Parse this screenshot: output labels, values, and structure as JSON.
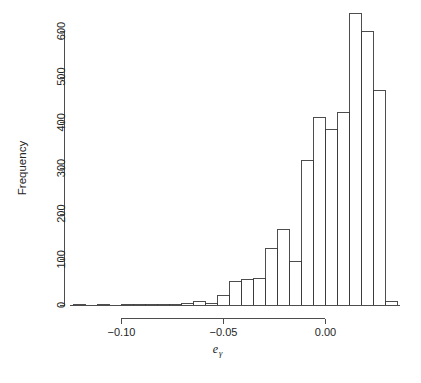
{
  "figure": {
    "ylabel": "Frequency",
    "xlabel_base": "e",
    "xlabel_sub": "γ",
    "caption_fragment": ""
  },
  "chart_data": {
    "type": "bar",
    "title": "",
    "xlabel": "eγ",
    "ylabel": "Frequency",
    "grid": false,
    "legend": "none",
    "xlim": [
      -0.128,
      0.0295
    ],
    "ylim": [
      0,
      640
    ],
    "ytick_values": [
      0,
      100,
      200,
      300,
      400,
      500,
      600
    ],
    "ytick_labels": [
      "0",
      "100",
      "200",
      "300",
      "400",
      "500",
      "600"
    ],
    "xtick_values": [
      -0.1,
      -0.05,
      0.0
    ],
    "xtick_labels": [
      "-0.10",
      "-0.05",
      "0.00"
    ],
    "bin_width": 0.006,
    "bin_left_edges": [
      -0.128,
      -0.122,
      -0.116,
      -0.11,
      -0.104,
      -0.098,
      -0.092,
      -0.086,
      -0.08,
      -0.074,
      -0.068,
      -0.062,
      -0.056,
      -0.05,
      -0.044,
      -0.038,
      -0.032,
      -0.026,
      -0.02,
      -0.014,
      -0.008,
      -0.002,
      0.004,
      0.01,
      0.016,
      0.022
    ],
    "values": [
      1,
      0,
      1,
      0,
      1,
      1,
      2,
      2,
      3,
      4,
      9,
      5,
      21,
      52,
      58,
      59,
      125,
      167,
      97,
      318,
      412,
      385,
      422,
      600,
      470,
      390
    ],
    "extra_bins": {
      "note": "two tallest bins sit between 0.00 and 0.02",
      "bin_left_edges": [
        0.004,
        0.016,
        0.022
      ],
      "values": [
        640,
        508,
        193
      ]
    },
    "tail_bin": {
      "left_edge": 0.028,
      "value": 8
    },
    "peak_value": 640,
    "categories": [
      "-0.128",
      "-0.122",
      "-0.116",
      "-0.110",
      "-0.104",
      "-0.098",
      "-0.092",
      "-0.086",
      "-0.080",
      "-0.074",
      "-0.068",
      "-0.062",
      "-0.056",
      "-0.050",
      "-0.044",
      "-0.038",
      "-0.032",
      "-0.026",
      "-0.020",
      "-0.014",
      "-0.008",
      "-0.002",
      "0.004",
      "0.010",
      "0.016",
      "0.022"
    ]
  },
  "geometry": {
    "plot_left_px": 70,
    "plot_right_px": 400,
    "y_zero_px": 305,
    "y_600_px": 31,
    "x_tick_minus010_px": 121,
    "x_tick_000_px": 325,
    "bar_px_width": 12,
    "bars": [
      {
        "x": 73,
        "h": 1
      },
      {
        "x": 85,
        "h": 0
      },
      {
        "x": 97,
        "h": 1
      },
      {
        "x": 109,
        "h": 0
      },
      {
        "x": 121,
        "h": 1
      },
      {
        "x": 133,
        "h": 1
      },
      {
        "x": 145,
        "h": 2
      },
      {
        "x": 157,
        "h": 2
      },
      {
        "x": 169,
        "h": 3
      },
      {
        "x": 181,
        "h": 5
      },
      {
        "x": 193,
        "h": 9
      },
      {
        "x": 205,
        "h": 5
      },
      {
        "x": 217,
        "h": 21
      },
      {
        "x": 229,
        "h": 52
      },
      {
        "x": 241,
        "h": 58
      },
      {
        "x": 253,
        "h": 59
      },
      {
        "x": 265,
        "h": 125
      },
      {
        "x": 277,
        "h": 167
      },
      {
        "x": 289,
        "h": 97
      },
      {
        "x": 301,
        "h": 318
      },
      {
        "x": 313,
        "h": 412
      },
      {
        "x": 325,
        "h": 385
      },
      {
        "x": 337,
        "h": 422
      },
      {
        "x": 349,
        "h": 640
      },
      {
        "x": 361,
        "h": 600
      },
      {
        "x": 373,
        "h": 470
      }
    ],
    "bars_right": [
      {
        "x": 337,
        "h": 422
      },
      {
        "x": 349,
        "h": 640
      },
      {
        "x": 361,
        "h": 600
      },
      {
        "x": 373,
        "h": 470
      }
    ]
  }
}
